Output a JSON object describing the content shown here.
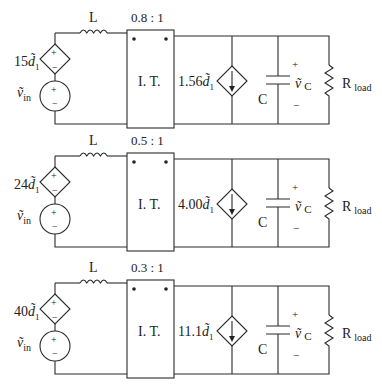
{
  "figure": {
    "circuits": [
      {
        "source_gain": "15",
        "duty_symbol": "d̃",
        "duty_sub": "1",
        "inductor_label": "L",
        "turns_ratio": "0.8 : 1",
        "transformer_label": "I. T.",
        "current_gain": "1.56",
        "capacitor_label": "C",
        "vc_label": "ṽ",
        "vc_sub": "C",
        "vin_label": "ṽ",
        "vin_sub": "in",
        "load_label": "R",
        "load_sub": "load",
        "plus": "+",
        "minus": "−"
      },
      {
        "source_gain": "24",
        "duty_symbol": "d̃",
        "duty_sub": "1",
        "inductor_label": "L",
        "turns_ratio": "0.5 : 1",
        "transformer_label": "I. T.",
        "current_gain": "4.00",
        "capacitor_label": "C",
        "vc_label": "ṽ",
        "vc_sub": "C",
        "vin_label": "ṽ",
        "vin_sub": "in",
        "load_label": "R",
        "load_sub": "load",
        "plus": "+",
        "minus": "−"
      },
      {
        "source_gain": "40",
        "duty_symbol": "d̃",
        "duty_sub": "1",
        "inductor_label": "L",
        "turns_ratio": "0.3 : 1",
        "transformer_label": "I. T.",
        "current_gain": "11.1",
        "capacitor_label": "C",
        "vc_label": "ṽ",
        "vc_sub": "C",
        "vin_label": "ṽ",
        "vin_sub": "in",
        "load_label": "R",
        "load_sub": "load",
        "plus": "+",
        "minus": "−"
      }
    ]
  }
}
